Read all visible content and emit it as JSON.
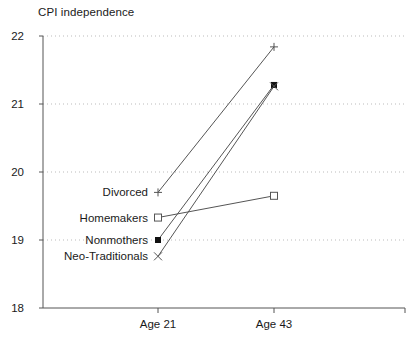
{
  "chart_data": {
    "type": "line",
    "title": "CPI independence",
    "xlabel": "",
    "ylabel": "",
    "categories": [
      "Age 21",
      "Age 43"
    ],
    "x_tick_labels": [
      "Age 21",
      "Age 43"
    ],
    "y_tick_labels": [
      "18",
      "19",
      "20",
      "21",
      "22"
    ],
    "y_ticks": [
      18,
      19,
      20,
      21,
      22
    ],
    "ylim": [
      18,
      22
    ],
    "grid": "horizontal-dotted",
    "legend_position": "inline-left-labels",
    "series": [
      {
        "name": "Divorced",
        "marker": "plus",
        "values": [
          19.7,
          21.84
        ]
      },
      {
        "name": "Homemakers",
        "marker": "open-square",
        "values": [
          19.33,
          19.65
        ]
      },
      {
        "name": "Nonmothers",
        "marker": "filled-square",
        "values": [
          19.0,
          21.28
        ]
      },
      {
        "name": "Neo-Traditionals",
        "marker": "cross-x",
        "values": [
          18.76,
          21.26
        ]
      }
    ],
    "colors": {
      "line": "#555555",
      "axis": "#555555",
      "grid": "#bbbbbb",
      "text": "#1a1a1a"
    }
  }
}
